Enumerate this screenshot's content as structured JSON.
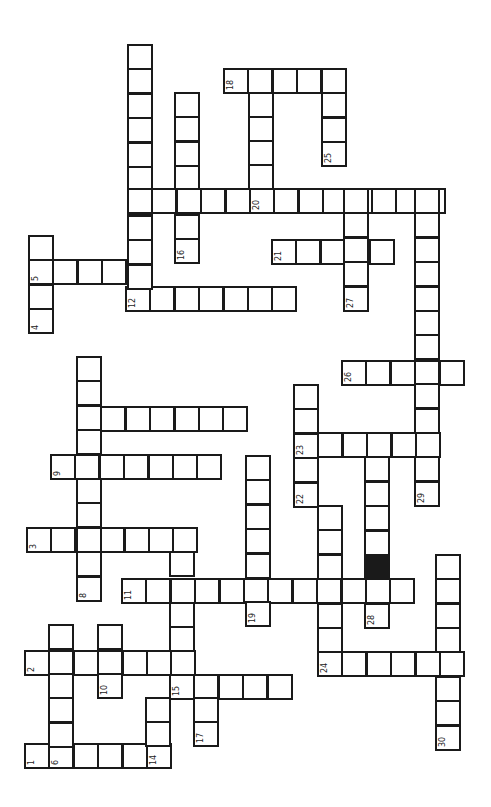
{
  "puzzle": {
    "title": "",
    "orientation": "rotated-90",
    "cell_size": 24.4,
    "colors": {
      "line": "#1a1a1a",
      "background": "#ffffff",
      "block": "#1a1a1a"
    },
    "blocked_cells": [
      {
        "x": 364,
        "y": 554
      }
    ],
    "words": [
      {
        "num": "1",
        "dir": "row",
        "x": 24,
        "y": 743,
        "len": 6,
        "label_at": 0
      },
      {
        "num": "2",
        "dir": "row",
        "x": 24,
        "y": 650,
        "len": 7,
        "label_at": 0
      },
      {
        "num": "3",
        "dir": "row",
        "x": 26,
        "y": 527,
        "len": 7,
        "label_at": 0
      },
      {
        "num": "4",
        "dir": "col",
        "x": 28,
        "y": 235,
        "len": 4,
        "label_at": 3
      },
      {
        "num": "5",
        "dir": "row",
        "x": 28,
        "y": 259,
        "len": 5,
        "label_at": 0
      },
      {
        "num": "6",
        "dir": "col",
        "x": 48,
        "y": 624,
        "len": 6,
        "label_at": 5
      },
      {
        "num": "7",
        "dir": "row",
        "x": 76,
        "y": 406,
        "len": 7,
        "label_at": 0
      },
      {
        "num": "8",
        "dir": "col",
        "x": 76,
        "y": 356,
        "len": 10,
        "label_at": 9
      },
      {
        "num": "9",
        "dir": "row",
        "x": 50,
        "y": 454,
        "len": 7,
        "label_at": 0
      },
      {
        "num": "10",
        "dir": "col",
        "x": 97,
        "y": 624,
        "len": 3,
        "label_at": 2
      },
      {
        "num": "11",
        "dir": "row",
        "x": 121,
        "y": 578,
        "len": 12,
        "label_at": 0
      },
      {
        "num": "12",
        "dir": "row",
        "x": 125,
        "y": 286,
        "len": 7,
        "label_at": 0
      },
      {
        "num": "13",
        "dir": "col",
        "x": 127,
        "y": 44,
        "len": 11,
        "label_at": 6
      },
      {
        "num": "14",
        "dir": "col",
        "x": 145,
        "y": 697,
        "len": 3,
        "label_at": 2
      },
      {
        "num": "15",
        "dir": "row",
        "x": 169,
        "y": 674,
        "len": 5,
        "label_at": 0
      },
      {
        "num": "16",
        "dir": "col",
        "x": 174,
        "y": 92,
        "len": 7,
        "label_at": 6
      },
      {
        "num": "17",
        "dir": "col",
        "x": 193,
        "y": 697,
        "len": 2,
        "label_at": 1
      },
      {
        "num": "18",
        "dir": "row",
        "x": 223,
        "y": 68,
        "len": 5,
        "label_at": 0
      },
      {
        "num": "19",
        "dir": "col",
        "x": 245,
        "y": 455,
        "len": 7,
        "label_at": 6
      },
      {
        "num": "20",
        "dir": "row",
        "x": 127,
        "y": 188,
        "len": 13,
        "label_at": 5
      },
      {
        "num": "21",
        "dir": "row",
        "x": 271,
        "y": 239,
        "len": 5,
        "label_at": 0
      },
      {
        "num": "22",
        "dir": "col",
        "x": 293,
        "y": 384,
        "len": 5,
        "label_at": 4
      },
      {
        "num": "23",
        "dir": "row",
        "x": 293,
        "y": 432,
        "len": 6,
        "label_at": 0
      },
      {
        "num": "24",
        "dir": "row",
        "x": 317,
        "y": 651,
        "len": 6,
        "label_at": 0
      },
      {
        "num": "25",
        "dir": "col",
        "x": 321,
        "y": 68,
        "len": 4,
        "label_at": 3
      },
      {
        "num": "26",
        "dir": "row",
        "x": 341,
        "y": 360,
        "len": 5,
        "label_at": 0
      },
      {
        "num": "27",
        "dir": "col",
        "x": 343,
        "y": 188,
        "len": 5,
        "label_at": 4
      },
      {
        "num": "28",
        "dir": "col",
        "x": 364,
        "y": 432,
        "len": 8,
        "label_at": 7
      },
      {
        "num": "29",
        "dir": "col",
        "x": 414,
        "y": 188,
        "len": 13,
        "label_at": 12
      },
      {
        "num": "30",
        "dir": "col",
        "x": 435,
        "y": 554,
        "len": 8,
        "label_at": 7
      }
    ],
    "extra_cells": [
      {
        "x": 248,
        "y": 92
      },
      {
        "x": 248,
        "y": 116
      },
      {
        "x": 248,
        "y": 140
      },
      {
        "x": 248,
        "y": 164
      },
      {
        "x": 317,
        "y": 505
      },
      {
        "x": 317,
        "y": 529
      },
      {
        "x": 317,
        "y": 554
      },
      {
        "x": 317,
        "y": 603
      },
      {
        "x": 317,
        "y": 627
      },
      {
        "x": 169,
        "y": 551
      },
      {
        "x": 169,
        "y": 602
      },
      {
        "x": 169,
        "y": 626
      },
      {
        "x": 169,
        "y": 650
      }
    ]
  }
}
